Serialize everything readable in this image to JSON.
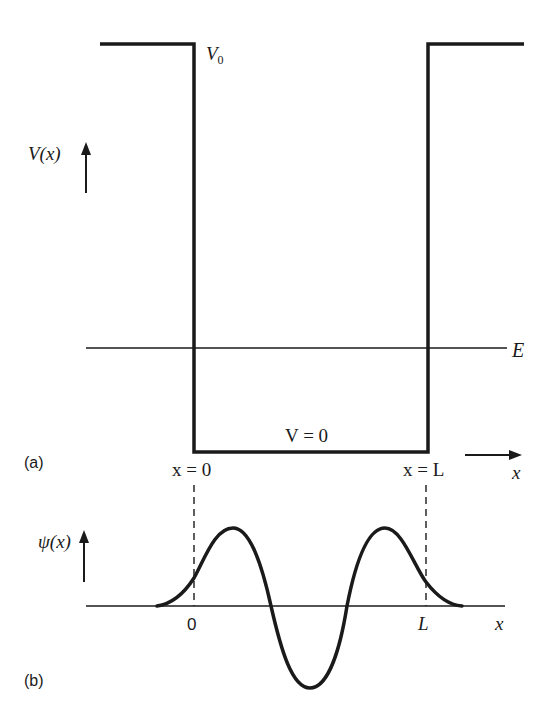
{
  "panel_a": {
    "label": "(a)",
    "y_axis_label": "V(x)",
    "barrier_label": "V",
    "barrier_subscript": "0",
    "energy_label": "E",
    "well_floor_label": "V = 0",
    "left_wall_label": "x = 0",
    "right_wall_label": "x = L",
    "x_axis_label": "x"
  },
  "panel_b": {
    "label": "(b)",
    "y_axis_label": "ψ(x)",
    "origin_tick": "0",
    "L_tick": "L",
    "x_axis_label": "x"
  },
  "colors": {
    "ink": "#1a1a1a",
    "background": "#ffffff"
  }
}
